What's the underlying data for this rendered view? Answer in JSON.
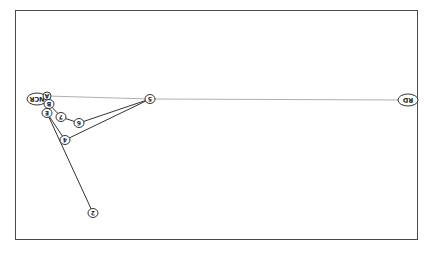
{
  "diagram": {
    "orientation": "rotated-180",
    "nodes": [
      {
        "id": "NCR",
        "label": "NCR"
      },
      {
        "id": "A",
        "label": "A"
      },
      {
        "id": "B",
        "label": "B"
      },
      {
        "id": "E",
        "label": "E"
      },
      {
        "id": "7",
        "label": "7"
      },
      {
        "id": "6",
        "label": "6"
      },
      {
        "id": "4",
        "label": "4"
      },
      {
        "id": "5",
        "label": "5"
      },
      {
        "id": "2",
        "label": "2"
      },
      {
        "id": "RD",
        "label": "RD"
      }
    ],
    "edges": [
      {
        "from": "A",
        "to": "5",
        "style": "thin-gray"
      },
      {
        "from": "5",
        "to": "RD",
        "style": "thin-gray"
      },
      {
        "from": "B",
        "to": "7",
        "style": "solid"
      },
      {
        "from": "7",
        "to": "6",
        "style": "solid"
      },
      {
        "from": "6",
        "to": "5",
        "style": "solid"
      },
      {
        "from": "E",
        "to": "4",
        "style": "solid"
      },
      {
        "from": "4",
        "to": "5",
        "style": "solid"
      },
      {
        "from": "E",
        "to": "2",
        "style": "solid"
      }
    ],
    "colors": {
      "line": "#333333",
      "gray_line": "#9a9a9a",
      "frame": "#4a4a4a"
    }
  }
}
